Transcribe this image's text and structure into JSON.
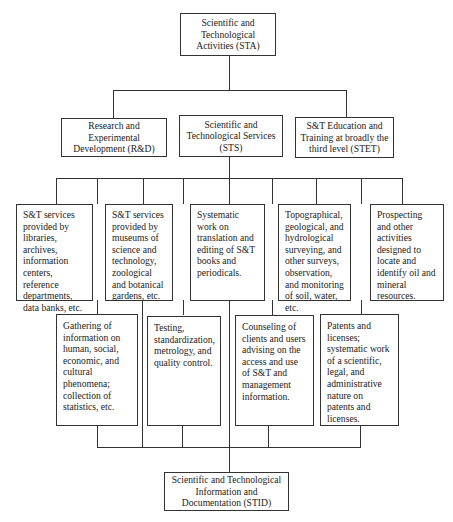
{
  "diagram": {
    "root": {
      "label": "Scientific and Technological Activities (STA)"
    },
    "level2": [
      {
        "label": "Research and Experimental Development (R&D)"
      },
      {
        "label": "Scientific and Technological Services (STS)"
      },
      {
        "label": "S&T Education and Training at broadly the third level (STET)"
      }
    ],
    "services_top": [
      {
        "label": "S&T services provided by libraries, archives, information centers, reference departments, data banks, etc."
      },
      {
        "label": "S&T services provided by museums of science and technology, zoological and botanical gardens, etc."
      },
      {
        "label": "Systematic work on translation and editing of S&T books and periodicals."
      },
      {
        "label": "Topographical, geological, and hydrological surveying, and other surveys, observation, and monitoring of soil, water, etc."
      },
      {
        "label": "Prospecting and other activities designed to locate and identify oil and mineral resources."
      }
    ],
    "services_bottom": [
      {
        "label": "Gathering of information on human, social, economic, and cultural phenomena; collection of statistics, etc."
      },
      {
        "label": "Testing, standardization, metrology, and quality control."
      },
      {
        "label": "Counseling of clients and users advising on the access and use of S&T and management information."
      },
      {
        "label": "Patents and licenses; systematic work of a scientific, legal, and administrative nature on patents and licenses."
      }
    ],
    "sink": {
      "label": "Scientific and Technological Information and Documentation (STID)"
    }
  }
}
